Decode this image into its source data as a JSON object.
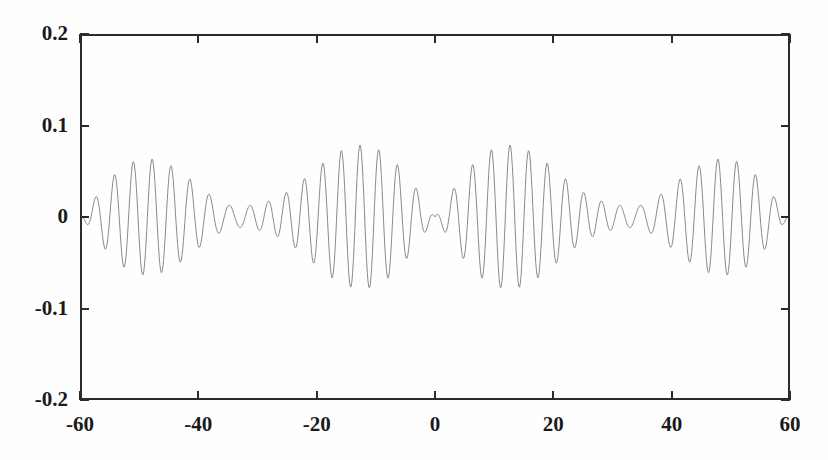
{
  "chart_data": {
    "type": "line",
    "title": "",
    "xlabel": "",
    "ylabel": "",
    "xlim": [
      -60,
      60
    ],
    "ylim": [
      -0.2,
      0.2
    ],
    "xticks": [
      -60,
      -40,
      -20,
      0,
      20,
      40,
      60
    ],
    "xtick_labels": [
      "-60",
      "-40",
      "-20",
      "0",
      "20",
      "40",
      "60"
    ],
    "yticks": [
      -0.2,
      -0.1,
      0,
      0.1,
      0.2
    ],
    "ytick_labels": [
      "-0.2",
      "-0.1",
      "0",
      "0.1",
      "0.2"
    ],
    "grid": false,
    "legend": null,
    "line_color": "#8a8a8a",
    "line_width": 1.0,
    "frame_color": "#2b2b2b",
    "background": "#ffffff",
    "series": [
      {
        "name": "signal",
        "carrier_period": 3.2,
        "envelope_peak": 0.195,
        "envelope_nulls": [
          -60,
          0,
          60
        ],
        "envelope_maxima": [
          -31,
          33
        ],
        "n_points": 961,
        "model": {
          "components": [
            {
              "amplitude": 0.1,
              "period": 3.2
            },
            {
              "amplitude": 0.055,
              "period": 3.05
            },
            {
              "amplitude": 0.04,
              "period": 3.38
            }
          ],
          "envelope": "abs(sin(pi*x/60))"
        },
        "sample_points": [
          {
            "x": -60.0,
            "y": -0.188
          },
          {
            "x": -58.5,
            "y": 0.062
          },
          {
            "x": -57.0,
            "y": -0.118
          },
          {
            "x": -55.0,
            "y": 0.04
          },
          {
            "x": -53.0,
            "y": -0.095
          },
          {
            "x": -51.0,
            "y": 0.041
          },
          {
            "x": -49.0,
            "y": -0.132
          },
          {
            "x": -46.5,
            "y": 0.056
          },
          {
            "x": -44.0,
            "y": -0.165
          },
          {
            "x": -41.5,
            "y": 0.103
          },
          {
            "x": -39.0,
            "y": -0.15
          },
          {
            "x": -36.0,
            "y": 0.158
          },
          {
            "x": -33.0,
            "y": -0.19
          },
          {
            "x": -31.0,
            "y": 0.193
          },
          {
            "x": -28.5,
            "y": -0.186
          },
          {
            "x": -26.0,
            "y": 0.14
          },
          {
            "x": -23.5,
            "y": -0.17
          },
          {
            "x": -21.0,
            "y": 0.192
          },
          {
            "x": -18.5,
            "y": -0.178
          },
          {
            "x": -16.0,
            "y": 0.155
          },
          {
            "x": -13.0,
            "y": 0.193
          },
          {
            "x": -11.0,
            "y": -0.16
          },
          {
            "x": -8.0,
            "y": 0.12
          },
          {
            "x": -5.5,
            "y": -0.13
          },
          {
            "x": -3.0,
            "y": 0.06
          },
          {
            "x": -1.0,
            "y": -0.04
          },
          {
            "x": 1.0,
            "y": 0.03
          },
          {
            "x": 4.0,
            "y": -0.055
          },
          {
            "x": 7.0,
            "y": 0.045
          },
          {
            "x": 10.0,
            "y": -0.095
          },
          {
            "x": 13.0,
            "y": 0.048
          },
          {
            "x": 16.0,
            "y": -0.12
          },
          {
            "x": 19.0,
            "y": 0.065
          },
          {
            "x": 22.0,
            "y": -0.15
          },
          {
            "x": 25.0,
            "y": 0.115
          },
          {
            "x": 28.0,
            "y": -0.165
          },
          {
            "x": 31.0,
            "y": 0.18
          },
          {
            "x": 33.5,
            "y": -0.188
          },
          {
            "x": 36.0,
            "y": 0.192
          },
          {
            "x": 39.0,
            "y": -0.175
          },
          {
            "x": 42.0,
            "y": 0.148
          },
          {
            "x": 45.0,
            "y": -0.185
          },
          {
            "x": 47.5,
            "y": 0.195
          },
          {
            "x": 50.0,
            "y": -0.18
          },
          {
            "x": 53.0,
            "y": 0.14
          },
          {
            "x": 56.0,
            "y": -0.165
          },
          {
            "x": 58.0,
            "y": 0.1
          },
          {
            "x": 60.0,
            "y": -0.16
          }
        ]
      }
    ]
  }
}
